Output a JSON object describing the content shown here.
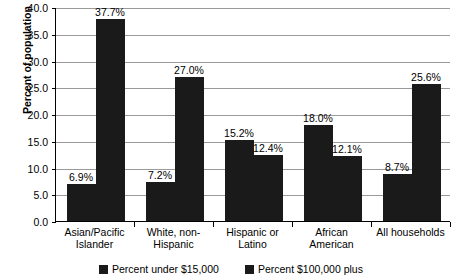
{
  "chart_data": {
    "type": "bar",
    "title": "",
    "xlabel": "",
    "ylabel": "Percent of population",
    "ylim": [
      0,
      40
    ],
    "ytick_step": 5,
    "ytick_labels": [
      "40.0",
      "35.0",
      "30.0",
      "25.0",
      "20.0",
      "15.0",
      "10.0",
      "5.0",
      "0.0"
    ],
    "ytick_values": [
      40,
      35,
      30,
      25,
      20,
      15,
      10,
      5,
      0
    ],
    "grid": true,
    "legend_position": "bottom",
    "categories": [
      "Asian/Pacific Islander",
      "White, non-Hispanic",
      "Hispanic or Latino",
      "African American",
      "All households"
    ],
    "category_lines": [
      [
        "Asian/Pacific",
        "Islander"
      ],
      [
        "White, non-",
        "Hispanic"
      ],
      [
        "Hispanic or",
        "Latino"
      ],
      [
        "African",
        "American"
      ],
      [
        "All households",
        ""
      ]
    ],
    "series": [
      {
        "name": "Percent under $15,000",
        "color": "#1a1a1a",
        "values": [
          6.9,
          7.2,
          15.2,
          18.0,
          8.7
        ],
        "labels": [
          "6.9%",
          "7.2%",
          "15.2%",
          "18.0%",
          "8.7%"
        ]
      },
      {
        "name": "Percent $100,000 plus",
        "color": "#1a1a1a",
        "values": [
          37.7,
          27.0,
          12.4,
          12.1,
          25.6
        ],
        "labels": [
          "37.7%",
          "27.0%",
          "12.4%",
          "12.1%",
          "25.6%"
        ]
      }
    ]
  }
}
